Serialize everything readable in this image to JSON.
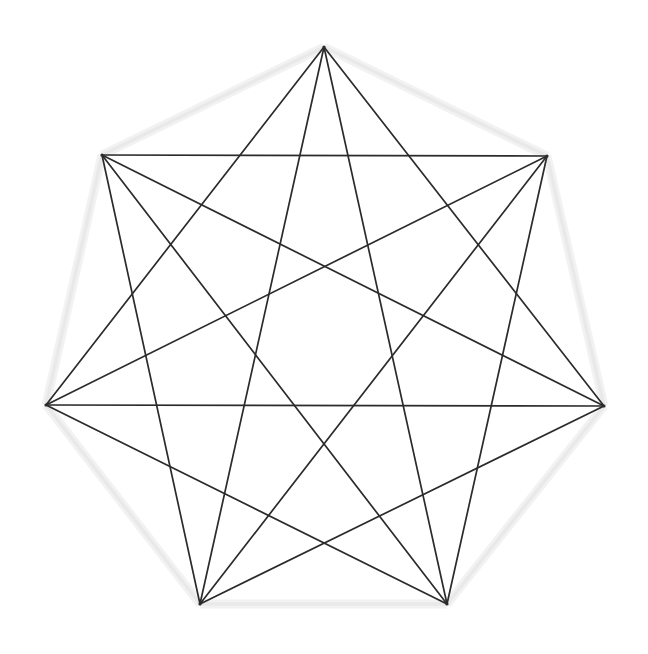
{
  "figure": {
    "kind": "star-polygon-diagram",
    "background_color": "#ffffff",
    "stroke_color": "#2b2b2b",
    "halo_color": "#f0f0f0",
    "stroke_width": 1.7,
    "canvas": {
      "width": 648,
      "height": 654
    }
  },
  "chart_data": {
    "type": "diagram",
    "subtype": "star-polygon",
    "title": "Heptagram {7/2} + {7/3} compound",
    "xlabel": "",
    "ylabel": "",
    "grid": false,
    "legend": "none",
    "n_vertices": 7,
    "schlafli_symbols": [
      "{7/2}",
      "{7/3}"
    ],
    "center": {
      "x": 325,
      "y": 371
    },
    "circumradius": 324,
    "start_angle_deg": -90,
    "vertex_degree": 4,
    "edge_count": 14,
    "polygon_sides_drawn": false,
    "vertices": [
      {
        "index": 0,
        "name": "top",
        "x": 324,
        "y": 47
      },
      {
        "index": 1,
        "name": "upper-right",
        "x": 547,
        "y": 156
      },
      {
        "index": 2,
        "name": "right",
        "x": 604,
        "y": 406
      },
      {
        "index": 3,
        "name": "lower-right",
        "x": 447,
        "y": 604
      },
      {
        "index": 4,
        "name": "lower-left",
        "x": 200,
        "y": 604
      },
      {
        "index": 5,
        "name": "left",
        "x": 46,
        "y": 405
      },
      {
        "index": 6,
        "name": "upper-left",
        "x": 102,
        "y": 155
      }
    ],
    "edges_step2": [
      [
        0,
        2
      ],
      [
        2,
        4
      ],
      [
        4,
        6
      ],
      [
        6,
        1
      ],
      [
        1,
        3
      ],
      [
        3,
        5
      ],
      [
        5,
        0
      ]
    ],
    "edges_step3": [
      [
        0,
        3
      ],
      [
        3,
        6
      ],
      [
        6,
        2
      ],
      [
        2,
        5
      ],
      [
        5,
        1
      ],
      [
        1,
        4
      ],
      [
        4,
        0
      ]
    ],
    "halo_outline": [
      [
        0,
        1
      ],
      [
        1,
        2
      ],
      [
        2,
        3
      ],
      [
        3,
        4
      ],
      [
        4,
        5
      ],
      [
        5,
        6
      ],
      [
        6,
        0
      ]
    ]
  }
}
